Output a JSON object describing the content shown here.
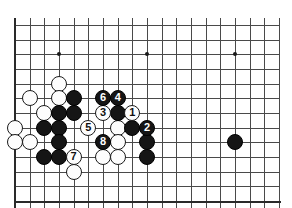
{
  "figure": {
    "kind": "go-board-diagram",
    "board": {
      "columns": 19,
      "rows": 13,
      "origin_x": 15,
      "origin_y": 25,
      "spacing": 14.67,
      "line_color": "#4a4a4a",
      "edge_color": "#2a2a2a",
      "background_color": "#ffffff",
      "black_color": "#151515",
      "white_color": "#fdfdfd"
    },
    "hoshi_points": [
      {
        "name": "star-point-left",
        "col": 3,
        "row": 2
      },
      {
        "name": "star-point-center",
        "col": 9,
        "row": 2
      },
      {
        "name": "star-point-right",
        "col": 15,
        "row": 2
      }
    ],
    "stones": [
      {
        "name": "white-stone-d5",
        "color": "white",
        "col": 3,
        "row": 4,
        "label": ""
      },
      {
        "name": "white-stone-c6",
        "color": "white",
        "col": 1,
        "row": 5,
        "label": ""
      },
      {
        "name": "white-stone-e6",
        "color": "white",
        "col": 3,
        "row": 5,
        "label": ""
      },
      {
        "name": "black-stone-f6",
        "color": "black",
        "col": 4,
        "row": 5,
        "label": ""
      },
      {
        "name": "white-stone-d7",
        "color": "white",
        "col": 2,
        "row": 6,
        "label": ""
      },
      {
        "name": "black-stone-e7",
        "color": "black",
        "col": 3,
        "row": 6,
        "label": ""
      },
      {
        "name": "black-stone-f7",
        "color": "black",
        "col": 4,
        "row": 6,
        "label": ""
      },
      {
        "name": "white-stone-b8",
        "color": "white",
        "col": 0,
        "row": 7,
        "label": ""
      },
      {
        "name": "black-stone-c8",
        "color": "black",
        "col": 2,
        "row": 7,
        "label": ""
      },
      {
        "name": "black-stone-d8",
        "color": "black",
        "col": 3,
        "row": 7,
        "label": ""
      },
      {
        "name": "white-stone-b9",
        "color": "white",
        "col": 0,
        "row": 8,
        "label": ""
      },
      {
        "name": "white-stone-c9",
        "color": "white",
        "col": 1,
        "row": 8,
        "label": ""
      },
      {
        "name": "black-stone-d9",
        "color": "black",
        "col": 3,
        "row": 8,
        "label": ""
      },
      {
        "name": "black-stone-c10",
        "color": "black",
        "col": 2,
        "row": 9,
        "label": ""
      },
      {
        "name": "black-stone-d10",
        "color": "black",
        "col": 3,
        "row": 9,
        "label": ""
      },
      {
        "name": "white-stone-e11",
        "color": "white",
        "col": 4,
        "row": 10,
        "label": ""
      },
      {
        "name": "white-stone-g9",
        "color": "white",
        "col": 6,
        "row": 9,
        "label": ""
      },
      {
        "name": "white-stone-h8",
        "color": "white",
        "col": 7,
        "row": 7,
        "label": ""
      },
      {
        "name": "white-stone-h9",
        "color": "white",
        "col": 7,
        "row": 8,
        "label": ""
      },
      {
        "name": "white-stone-h10",
        "color": "white",
        "col": 7,
        "row": 9,
        "label": ""
      },
      {
        "name": "black-stone-i6",
        "color": "black",
        "col": 7,
        "row": 6,
        "label": ""
      },
      {
        "name": "black-stone-j8",
        "color": "black",
        "col": 8,
        "row": 7,
        "label": ""
      },
      {
        "name": "black-stone-k9",
        "color": "black",
        "col": 9,
        "row": 8,
        "label": ""
      },
      {
        "name": "black-stone-k10",
        "color": "black",
        "col": 9,
        "row": 9,
        "label": ""
      },
      {
        "name": "black-stone-right-hoshi",
        "color": "black",
        "col": 15,
        "row": 8,
        "label": ""
      },
      {
        "name": "move-stone-1",
        "color": "white",
        "col": 8,
        "row": 6,
        "label": "1"
      },
      {
        "name": "move-stone-2",
        "color": "black",
        "col": 9,
        "row": 7,
        "label": "2"
      },
      {
        "name": "move-stone-3",
        "color": "white",
        "col": 6,
        "row": 6,
        "label": "3"
      },
      {
        "name": "move-stone-4",
        "color": "black",
        "col": 7,
        "row": 5,
        "label": "4"
      },
      {
        "name": "move-stone-5",
        "color": "white",
        "col": 5,
        "row": 7,
        "label": "5"
      },
      {
        "name": "move-stone-6",
        "color": "black",
        "col": 6,
        "row": 5,
        "label": "6"
      },
      {
        "name": "move-stone-7",
        "color": "white",
        "col": 4,
        "row": 9,
        "label": "7"
      },
      {
        "name": "move-stone-8",
        "color": "black",
        "col": 6,
        "row": 8,
        "label": "8"
      }
    ]
  }
}
